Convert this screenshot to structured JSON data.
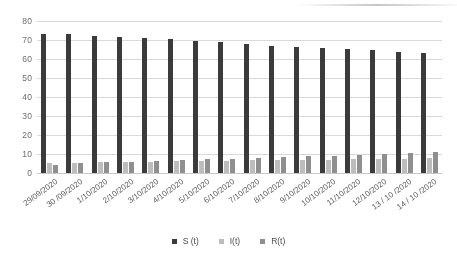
{
  "chart_data": {
    "type": "bar",
    "title": "",
    "subtitle": "",
    "xlabel": "",
    "ylabel": "",
    "ylim": [
      0,
      80
    ],
    "yticks": [
      0,
      10,
      20,
      30,
      40,
      50,
      60,
      70,
      80
    ],
    "grid": true,
    "legend_position": "bottom",
    "categories": [
      "29/09/2020",
      "30 /09/2020",
      "1/10/2020",
      "2/10/2020",
      "3/10/2020",
      "4/10/2020",
      "5/10/2020",
      "6/10/2020",
      "7/10/2020",
      "8/10/2020",
      "9/10/2020",
      "10/10/2020",
      "11/10/2020",
      "12/10/2020",
      "13 / 10 /2020",
      "14 / 10 /2020"
    ],
    "series": [
      {
        "name": "S (t)",
        "color": "#3b3b3b",
        "values": [
          73.3,
          73.1,
          72.3,
          71.6,
          70.8,
          70.3,
          69.6,
          68.8,
          67.8,
          67.0,
          66.4,
          65.9,
          65.3,
          64.5,
          63.9,
          63.2
        ]
      },
      {
        "name": "I(t)",
        "color": "#bdbdbd",
        "values": [
          5.3,
          5.4,
          5.7,
          5.8,
          6.0,
          6.2,
          6.3,
          6.4,
          6.6,
          6.7,
          6.8,
          7.0,
          7.2,
          7.4,
          7.6,
          7.8
        ]
      },
      {
        "name": "R(t)",
        "color": "#8f8f8f",
        "values": [
          4.4,
          5.2,
          5.6,
          6.0,
          6.5,
          6.8,
          7.2,
          7.6,
          8.1,
          8.5,
          8.9,
          9.2,
          9.6,
          10.0,
          10.4,
          10.8
        ]
      }
    ]
  }
}
